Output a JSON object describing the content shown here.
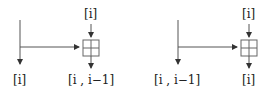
{
  "diagrams": [
    {
      "top_label": "[i]",
      "bottom_left_label": "[i]",
      "bottom_right_label": "[i , i−1]"
    },
    {
      "top_label": "[i]",
      "bottom_left_label": "[i , i−1]",
      "bottom_right_label": "[i]"
    }
  ],
  "colors": {
    "line": "#555555",
    "box": "#666666"
  }
}
